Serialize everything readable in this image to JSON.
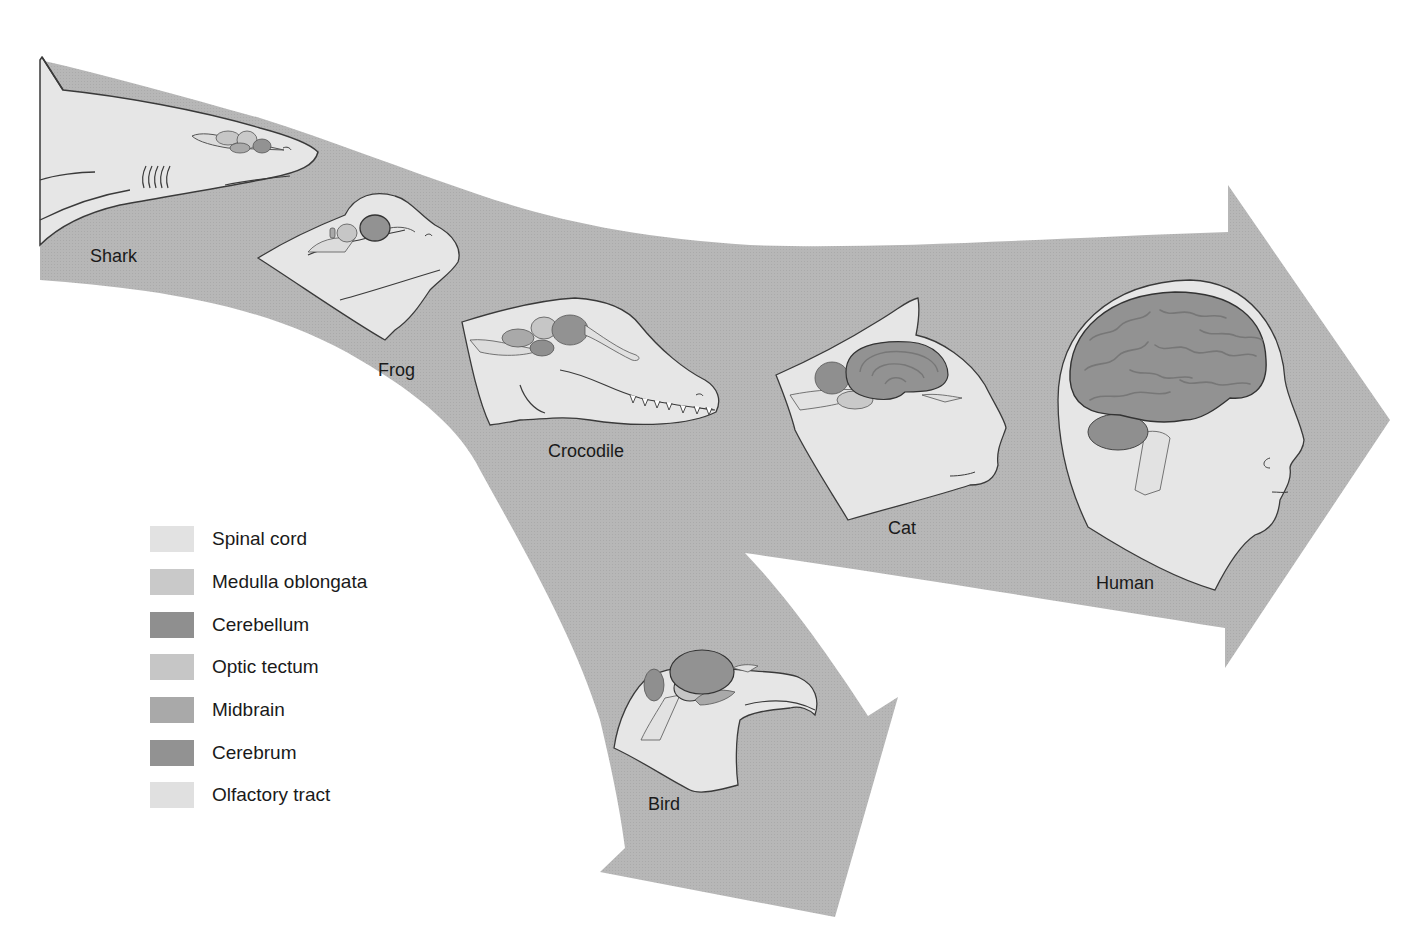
{
  "figure": {
    "title": "",
    "colors": {
      "band": "#b5b5b5",
      "head_fill": "#e6e6e6",
      "outline": "#3a3a3a",
      "background": "#ffffff"
    },
    "animals": [
      {
        "name": "Shark",
        "label_x": 90,
        "label_y": 246
      },
      {
        "name": "Frog",
        "label_x": 378,
        "label_y": 360
      },
      {
        "name": "Crocodile",
        "label_x": 548,
        "label_y": 441
      },
      {
        "name": "Cat",
        "label_x": 888,
        "label_y": 518
      },
      {
        "name": "Human",
        "label_x": 1096,
        "label_y": 573
      },
      {
        "name": "Bird",
        "label_x": 648,
        "label_y": 794
      }
    ]
  },
  "legend": {
    "items": [
      {
        "label": "Spinal cord",
        "color": "#e2e2e2"
      },
      {
        "label": "Medulla oblongata",
        "color": "#c9c9c9"
      },
      {
        "label": "Cerebellum",
        "color": "#8f8f8f"
      },
      {
        "label": "Optic tectum",
        "color": "#c6c6c6"
      },
      {
        "label": "Midbrain",
        "color": "#a9a9a9"
      },
      {
        "label": "Cerebrum",
        "color": "#929292"
      },
      {
        "label": "Olfactory tract",
        "color": "#e0e0e0"
      }
    ]
  }
}
